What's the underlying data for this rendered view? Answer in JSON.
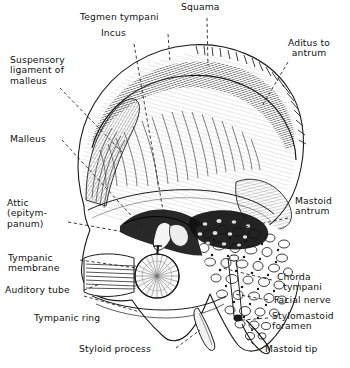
{
  "figure": {
    "style": "pen-and-ink line engraving, black on white",
    "background_color": "#ffffff",
    "ink_color": "#1a1a1a",
    "leader_line_style": "dashed"
  },
  "labels": {
    "tegmen_tympani": "Tegmen tympani",
    "squama": "Squama",
    "incus": "Incus",
    "aditus_to_antrum": "Aditus to\nantrum",
    "suspensory_ligament": "Suspensory\nligament of\nmalleus",
    "malleus": "Malleus",
    "attic": "Attic\n(epitym-\npanum)",
    "mastoid_antrum": "Mastoid\nantrum",
    "tympanic_membrane": "Tympanic\nmembrane",
    "auditory_tube": "Auditory tube",
    "chorda_tympani": "Chorda\n  tympani",
    "facial_nerve": "Facial nerve",
    "tympanic_ring": "Tympanic ring",
    "stylomastoid_foramen": "Stylomastoid\nforamen",
    "styloid_process": "Styloid process",
    "mastoid_tip": "Mastoid tip"
  },
  "caption": {
    "text": ""
  }
}
